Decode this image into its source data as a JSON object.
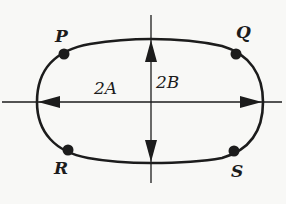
{
  "diagram": {
    "labels": {
      "P": "P",
      "Q": "Q",
      "R": "R",
      "S": "S"
    },
    "dimensions": {
      "horizontal": "2A",
      "vertical": "2B"
    },
    "colors": {
      "stroke": "#1c1c1c",
      "background": "#f8f8f6"
    }
  }
}
